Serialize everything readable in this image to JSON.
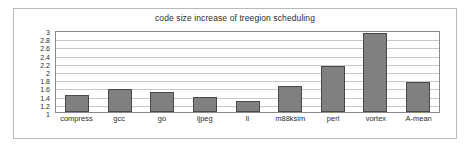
{
  "chart_data": {
    "type": "bar",
    "title": "code size increase of treegion scheduling",
    "xlabel": "",
    "ylabel": "",
    "categories": [
      "compress",
      "gcc",
      "go",
      "ijpeg",
      "li",
      "m88ksim",
      "perl",
      "vortex",
      "A-mean"
    ],
    "values": [
      1.42,
      1.55,
      1.48,
      1.37,
      1.27,
      1.63,
      2.13,
      2.93,
      1.73
    ],
    "series": [
      {
        "name": "code size increase",
        "values": [
          1.42,
          1.55,
          1.48,
          1.37,
          1.27,
          1.63,
          2.13,
          2.93,
          1.73
        ]
      }
    ],
    "ylim": [
      1,
      3
    ],
    "ytick_labels": [
      "3",
      "2.8",
      "2.6",
      "2.4",
      "2.2",
      "2",
      "1.8",
      "1.6",
      "1.4",
      "1.2",
      "1"
    ],
    "ytick_values": [
      3,
      2.8,
      2.6,
      2.4,
      2.2,
      2,
      1.8,
      1.6,
      1.4,
      1.2,
      1
    ],
    "grid": true,
    "legend": "none",
    "bar_color": "#808080",
    "bar_border_color": "#4a4a4a",
    "gridline_color": "#c8c8c8",
    "plot_border_color": "#8a8a8a",
    "frame_border_color": "#b9b9b9"
  }
}
